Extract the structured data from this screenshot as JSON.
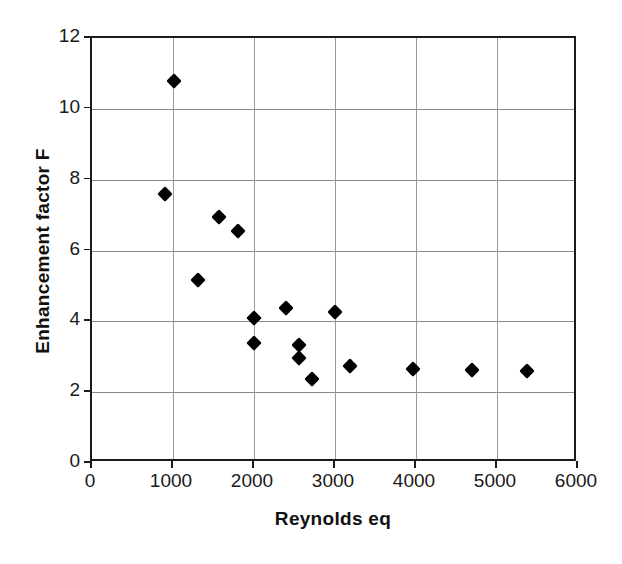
{
  "chart_data": {
    "type": "scatter",
    "title": "",
    "xlabel": "Reynolds eq",
    "ylabel": "Enhancement factor F",
    "xlim": [
      0,
      6000
    ],
    "ylim": [
      0,
      12
    ],
    "xticks": [
      0,
      1000,
      2000,
      3000,
      4000,
      5000,
      6000
    ],
    "yticks": [
      0,
      2,
      4,
      6,
      8,
      10,
      12
    ],
    "xtick_labels": [
      "0",
      "1000",
      "2000",
      "3000",
      "4000",
      "5000",
      "6000"
    ],
    "ytick_labels": [
      "0",
      "2",
      "4",
      "6",
      "8",
      "10",
      "12"
    ],
    "grid": true,
    "legend": false,
    "marker": "diamond",
    "marker_color": "#000000",
    "series": [
      {
        "name": "Enhancement factor F",
        "points": [
          {
            "x": 1010,
            "y": 10.8
          },
          {
            "x": 900,
            "y": 7.6
          },
          {
            "x": 1570,
            "y": 6.95
          },
          {
            "x": 1805,
            "y": 6.55
          },
          {
            "x": 1310,
            "y": 5.18
          },
          {
            "x": 2395,
            "y": 4.38
          },
          {
            "x": 3000,
            "y": 4.27
          },
          {
            "x": 2000,
            "y": 4.1
          },
          {
            "x": 2000,
            "y": 3.4
          },
          {
            "x": 2550,
            "y": 3.33
          },
          {
            "x": 2550,
            "y": 2.97
          },
          {
            "x": 3185,
            "y": 2.73
          },
          {
            "x": 2720,
            "y": 2.37
          },
          {
            "x": 3965,
            "y": 2.65
          },
          {
            "x": 4695,
            "y": 2.62
          },
          {
            "x": 5370,
            "y": 2.6
          }
        ]
      }
    ]
  }
}
